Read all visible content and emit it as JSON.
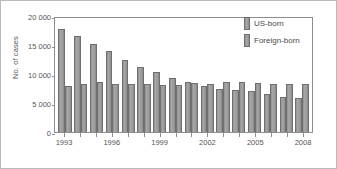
{
  "chart_data": {
    "type": "bar",
    "title": "",
    "xlabel": "",
    "ylabel": "No. of cases",
    "ylim": [
      0,
      20000
    ],
    "yticks": [
      0,
      5000,
      10000,
      15000,
      20000
    ],
    "ytick_labels": [
      "0",
      "5 000",
      "10 000",
      "15 000",
      "20 000"
    ],
    "grid": false,
    "legend_position": "top-right",
    "categories": [
      "1993",
      "1994",
      "1995",
      "1996",
      "1997",
      "1998",
      "1999",
      "2000",
      "2001",
      "2002",
      "2003",
      "2004",
      "2005",
      "2006",
      "2007",
      "2008"
    ],
    "xtick_labels": [
      "1993",
      "",
      "",
      "1996",
      "",
      "",
      "1999",
      "",
      "",
      "2002",
      "",
      "",
      "2005",
      "",
      "",
      "2008"
    ],
    "series": [
      {
        "name": "US-born",
        "color": "#9c9c9c",
        "values": [
          17800,
          16600,
          15200,
          14000,
          12500,
          11200,
          10350,
          9250,
          8550,
          7950,
          7450,
          7200,
          7050,
          6550,
          6100,
          5900
        ]
      },
      {
        "name": "Foreign-born",
        "color": "#9c9c9c",
        "values": [
          7950,
          8350,
          8550,
          8350,
          8350,
          8200,
          8050,
          8150,
          8500,
          8350,
          8550,
          8600,
          8400,
          8350,
          8350,
          8250
        ]
      }
    ]
  },
  "legend": {
    "items": [
      {
        "label": "US-born"
      },
      {
        "label": "Foreign-born"
      }
    ]
  }
}
